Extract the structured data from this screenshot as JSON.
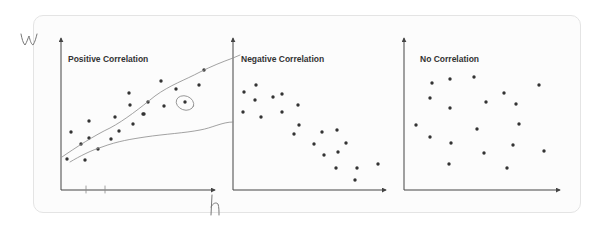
{
  "colors": {
    "card_border": "#e4e4e4",
    "card_bg": "#fcfcfc",
    "axis": "#444444",
    "dot": "#333333",
    "title": "#333333",
    "annotation": "#8a8a8a"
  },
  "annotations": {
    "y_axis_letter": "w",
    "x_axis_letter": "h"
  },
  "panels": [
    {
      "title": "Positive Correlation"
    },
    {
      "title": "Negative Correlation"
    },
    {
      "title": "No Correlation"
    }
  ],
  "chart_data": [
    {
      "type": "scatter",
      "title": "Positive Correlation",
      "xlabel": "h",
      "ylabel": "w",
      "points_px": [
        [
          67,
          159
        ],
        [
          71,
          132
        ],
        [
          81,
          144
        ],
        [
          85,
          160
        ],
        [
          89,
          121
        ],
        [
          89,
          138
        ],
        [
          98,
          149
        ],
        [
          111,
          139
        ],
        [
          115,
          117
        ],
        [
          119,
          131
        ],
        [
          129,
          93
        ],
        [
          130,
          105
        ],
        [
          133,
          124
        ],
        [
          143,
          114
        ],
        [
          144,
          114
        ],
        [
          148,
          102
        ],
        [
          161,
          81
        ],
        [
          164,
          106
        ],
        [
          176,
          89
        ],
        [
          185,
          102
        ],
        [
          199,
          85
        ],
        [
          204,
          70
        ]
      ],
      "hand_drawn": "two bounding lines drawn around the trend, one point circled"
    },
    {
      "type": "scatter",
      "title": "Negative Correlation",
      "points_px": [
        [
          243,
          112
        ],
        [
          244,
          92
        ],
        [
          255,
          100
        ],
        [
          256,
          85
        ],
        [
          261,
          117
        ],
        [
          273,
          97
        ],
        [
          282,
          94
        ],
        [
          282,
          112
        ],
        [
          294,
          134
        ],
        [
          298,
          105
        ],
        [
          299,
          125
        ],
        [
          314,
          144
        ],
        [
          322,
          132
        ],
        [
          324,
          155
        ],
        [
          336,
          168
        ],
        [
          337,
          130
        ],
        [
          338,
          152
        ],
        [
          346,
          143
        ],
        [
          355,
          180
        ],
        [
          357,
          168
        ],
        [
          378,
          164
        ]
      ]
    },
    {
      "type": "scatter",
      "title": "No Correlation",
      "points_px": [
        [
          416,
          125
        ],
        [
          430,
          98
        ],
        [
          430,
          137
        ],
        [
          432,
          83
        ],
        [
          449,
          164
        ],
        [
          450,
          79
        ],
        [
          450,
          108
        ],
        [
          451,
          143
        ],
        [
          474,
          77
        ],
        [
          477,
          129
        ],
        [
          484,
          153
        ],
        [
          486,
          102
        ],
        [
          504,
          93
        ],
        [
          507,
          168
        ],
        [
          513,
          145
        ],
        [
          516,
          104
        ],
        [
          519,
          124
        ],
        [
          539,
          85
        ],
        [
          544,
          151
        ]
      ]
    }
  ]
}
